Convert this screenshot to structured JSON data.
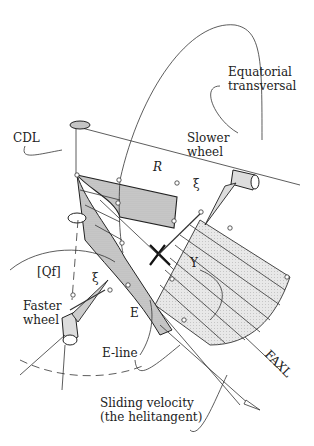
{
  "diagram": {
    "type": "gear-geometry-illustration",
    "labels": {
      "equatorial": "Equatorial",
      "transversal": "transversal",
      "cdl": "CDL",
      "slower": "Slower",
      "wheel_slow": "wheel",
      "r": "R",
      "xi_top": "ξ",
      "y": "Y",
      "qf": "[Qf]",
      "xi_bottom": "ξ",
      "faster": "Faster",
      "wheel_fast": "wheel",
      "e": "E",
      "eline": "E-line",
      "faxl": "FAXL",
      "sliding": "Sliding velocity",
      "helitangent": "(the helitangent)"
    },
    "colors": {
      "line": "#333333",
      "fill_dark": "#c8c8c8",
      "fill_light": "#e6e6e6",
      "background": "#ffffff"
    }
  }
}
